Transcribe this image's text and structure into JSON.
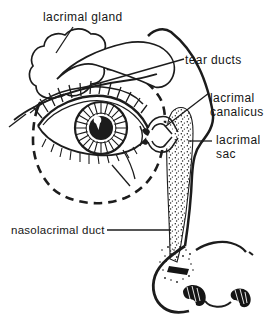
{
  "figure": {
    "style": "black ink line drawing with dashed orbit outline and stippled duct",
    "ink_color": "#1c1c1c",
    "background_color": "#ffffff",
    "parts": [
      "lacrimal gland",
      "tear ducts",
      "lacrimal canalicus",
      "lacrimal sac",
      "nasolacrimal duct",
      "eye",
      "orbit dashed outline",
      "nose"
    ]
  },
  "labels": {
    "lacrimal_gland": "lacrimal gland",
    "tear_ducts": "tear ducts",
    "lacrimal_canalicus": {
      "line1": "lacrimal",
      "line2": "canalicus"
    },
    "lacrimal_sac": {
      "line1": "lacrimal",
      "line2": "sac"
    },
    "nasolacrimal_duct": "nasolacrimal duct"
  }
}
